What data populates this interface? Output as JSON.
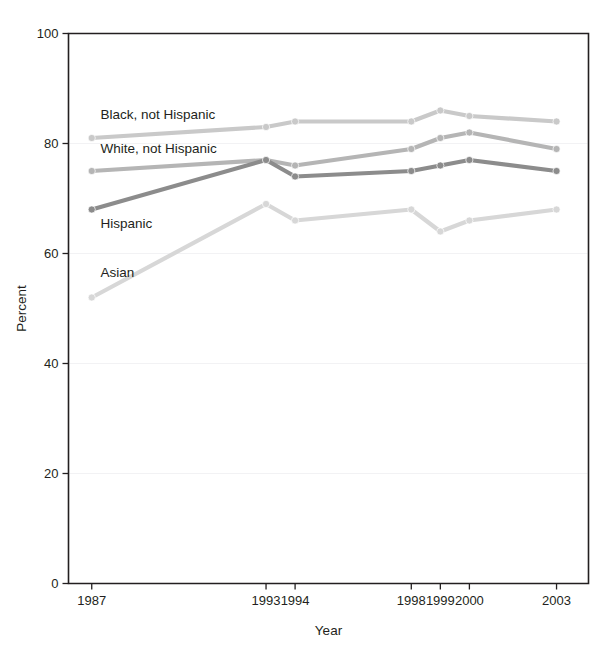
{
  "chart_data": {
    "type": "line",
    "title": "",
    "xlabel": "Year",
    "ylabel": "Percent",
    "ylim": [
      0,
      100
    ],
    "yticks": [
      0,
      20,
      40,
      60,
      80,
      100
    ],
    "xticks": [
      1987,
      1993,
      1994,
      1998,
      1999,
      2000,
      2003
    ],
    "x": [
      1987,
      1993,
      1994,
      1998,
      1999,
      2000,
      2003
    ],
    "grid": false,
    "legend_position": "in-plot labels",
    "series": [
      {
        "name": "Black, not Hispanic",
        "color": "#c9c9c9",
        "values": [
          81,
          83,
          84,
          84,
          86,
          85,
          84
        ]
      },
      {
        "name": "White, not Hispanic",
        "color": "#b5b5b5",
        "values": [
          75,
          77,
          76,
          79,
          81,
          82,
          79
        ]
      },
      {
        "name": "Hispanic",
        "color": "#8c8c8c",
        "values": [
          68,
          77,
          74,
          75,
          76,
          77,
          75
        ]
      },
      {
        "name": "Asian",
        "color": "#d7d7d7",
        "values": [
          52,
          69,
          66,
          68,
          64,
          66,
          68
        ]
      }
    ],
    "annotations": [
      {
        "text": "Black, not Hispanic",
        "x": 1987.3,
        "y": 84.5
      },
      {
        "text": "White, not Hispanic",
        "x": 1987.3,
        "y": 78.2
      },
      {
        "text": "Hispanic",
        "x": 1987.3,
        "y": 64.6
      },
      {
        "text": "Asian",
        "x": 1987.3,
        "y": 55.8
      }
    ]
  }
}
